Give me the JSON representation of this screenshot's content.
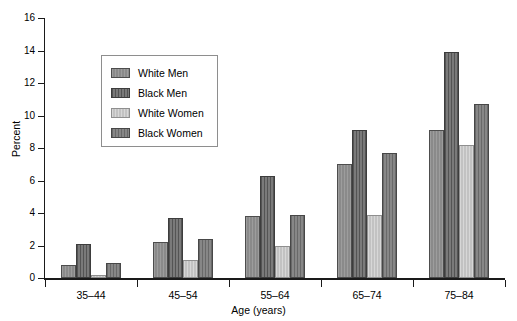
{
  "chart_data": {
    "type": "bar",
    "title": "",
    "subtitle": "",
    "xlabel": "Age (years)",
    "ylabel": "Percent",
    "categories": [
      "35–44",
      "45–54",
      "55–64",
      "65–74",
      "75–84"
    ],
    "series": [
      {
        "name": "White Men",
        "color": "#8a8a8a",
        "values": [
          0.8,
          2.2,
          3.8,
          7.0,
          9.1
        ]
      },
      {
        "name": "Black Men",
        "color": "#6b6b6b",
        "values": [
          2.1,
          3.7,
          6.3,
          9.1,
          13.9
        ]
      },
      {
        "name": "White Women",
        "color": "#c2c2c2",
        "values": [
          0.2,
          1.1,
          2.0,
          3.9,
          8.2
        ]
      },
      {
        "name": "Black Women",
        "color": "#7d7d7d",
        "values": [
          0.9,
          2.4,
          3.9,
          7.7,
          10.7
        ]
      }
    ],
    "ylim": [
      0,
      16
    ],
    "ytick_labels": [
      "0",
      "2",
      "4",
      "6",
      "8",
      "10",
      "12",
      "14",
      "16"
    ],
    "ytick_values": [
      0,
      2,
      4,
      6,
      8,
      10,
      12,
      14,
      16
    ],
    "grid": false,
    "legend_position": "upper-left-inside",
    "bar_group_gap": true
  },
  "axes": {
    "y_title": "Percent",
    "x_title": "Age (years)"
  },
  "legend": {
    "entries": [
      {
        "label": "White Men"
      },
      {
        "label": "Black Men"
      },
      {
        "label": "White Women"
      },
      {
        "label": "Black Women"
      }
    ]
  }
}
